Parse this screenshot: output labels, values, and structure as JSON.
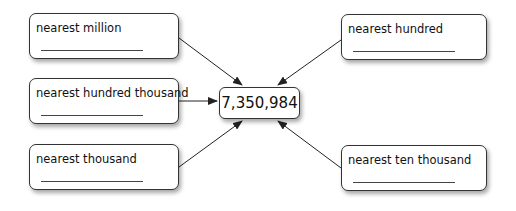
{
  "center": {
    "value": "7,350,984"
  },
  "boxes": [
    {
      "label": "nearest million"
    },
    {
      "label": "nearest hundred thousand"
    },
    {
      "label": "nearest thousand"
    },
    {
      "label": "nearest hundred"
    },
    {
      "label": "nearest ten thousand"
    }
  ]
}
